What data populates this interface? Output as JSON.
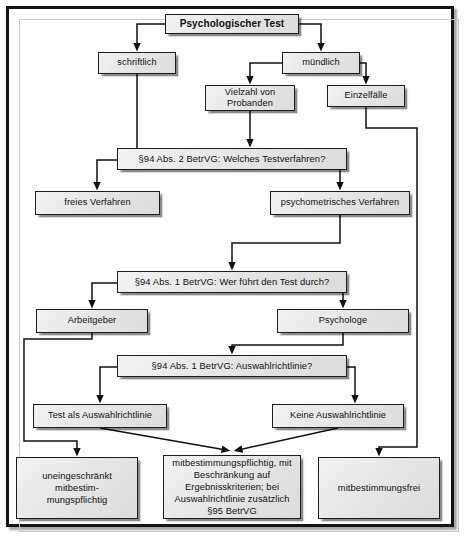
{
  "diagram": {
    "title": "Psychologischer Test",
    "nodes": [
      {
        "id": "root",
        "label": "Psychologischer Test",
        "kind": "root",
        "x": 165,
        "y": 14,
        "w": 134,
        "h": 20
      },
      {
        "id": "schriftlich",
        "label": "schriftlich",
        "kind": "box",
        "x": 98,
        "y": 52,
        "w": 78,
        "h": 22
      },
      {
        "id": "muendlich",
        "label": "mündlich",
        "kind": "box",
        "x": 282,
        "y": 52,
        "w": 78,
        "h": 22
      },
      {
        "id": "vielzahl",
        "label": "Vielzahl von Probanden",
        "kind": "box",
        "x": 205,
        "y": 85,
        "w": 90,
        "h": 26
      },
      {
        "id": "einzelfaelle",
        "label": "Einzelfälle",
        "kind": "box",
        "x": 327,
        "y": 85,
        "w": 78,
        "h": 22
      },
      {
        "id": "dec1",
        "label": "§94 Abs. 2 BetrVG: Welches Testverfahren?",
        "kind": "decision",
        "x": 117,
        "y": 148,
        "w": 230,
        "h": 22
      },
      {
        "id": "freies",
        "label": "freies Verfahren",
        "kind": "box",
        "x": 35,
        "y": 191,
        "w": 125,
        "h": 24
      },
      {
        "id": "psycho",
        "label": "psychometrisches Verfahren",
        "kind": "box",
        "x": 270,
        "y": 191,
        "w": 140,
        "h": 24
      },
      {
        "id": "dec2",
        "label": "§94 Abs. 1 BetrVG: Wer führt den Test durch?",
        "kind": "decision",
        "x": 117,
        "y": 271,
        "w": 230,
        "h": 22
      },
      {
        "id": "arbeitgeber",
        "label": "Arbeitgeber",
        "kind": "box",
        "x": 36,
        "y": 309,
        "w": 112,
        "h": 24
      },
      {
        "id": "psychologe",
        "label": "Psychologe",
        "kind": "box",
        "x": 277,
        "y": 309,
        "w": 132,
        "h": 24
      },
      {
        "id": "dec3",
        "label": "§94 Abs. 1 BetrVG: Auswahlrichtlinie?",
        "kind": "decision",
        "x": 117,
        "y": 355,
        "w": 230,
        "h": 22
      },
      {
        "id": "testals",
        "label": "Test als Auswahlrichtlinie",
        "kind": "box",
        "x": 33,
        "y": 404,
        "w": 134,
        "h": 24
      },
      {
        "id": "keineaus",
        "label": "Keine Auswahlrichtlinie",
        "kind": "box",
        "x": 272,
        "y": 404,
        "w": 132,
        "h": 24
      },
      {
        "id": "term-left",
        "label": "uneingeschränkt mitbestim-mungspflichtig",
        "kind": "terminal",
        "x": 16,
        "y": 457,
        "w": 122,
        "h": 62
      },
      {
        "id": "term-mid",
        "label": "mitbestimmungspflichtig, mit Beschränkung auf Ergebnisskriterien; bei Auswahlrichtlinie zusätzlich §95 BetrVG",
        "kind": "terminal",
        "x": 163,
        "y": 455,
        "w": 138,
        "h": 64
      },
      {
        "id": "term-right",
        "label": "mitbestimmungsfrei",
        "kind": "terminal",
        "x": 318,
        "y": 457,
        "w": 122,
        "h": 62
      }
    ],
    "terminal_lines": {
      "term-left": [
        "uneingeschränkt mitbestim-",
        "mungspflichtig"
      ],
      "term-mid": [
        "mitbestimmungspflichtig, mit",
        "Beschränkung auf",
        "Ergebnisskriterien; bei",
        "Auswahlrichtlinie zusätzlich",
        "§95 BetrVG"
      ],
      "term-right": [
        "mitbestimmungsfrei"
      ]
    },
    "node_lines": {
      "vielzahl": [
        "Vielzahl von",
        "Probanden"
      ]
    },
    "edges": [
      {
        "id": "root-to-schriftlich",
        "from": "root",
        "to": "schriftlich",
        "arrow": true
      },
      {
        "id": "root-to-muendlich",
        "from": "root",
        "to": "muendlich",
        "arrow": true
      },
      {
        "id": "muendlich-to-vielzahl",
        "from": "muendlich",
        "to": "vielzahl",
        "arrow": true
      },
      {
        "id": "muendlich-to-einzelfaelle",
        "from": "muendlich",
        "to": "einzelfaelle",
        "arrow": true
      },
      {
        "id": "schriftlich-to-dec1",
        "from": "schriftlich",
        "to": "dec1",
        "arrow": false
      },
      {
        "id": "vielzahl-to-dec1",
        "from": "vielzahl",
        "to": "dec1",
        "arrow": true
      },
      {
        "id": "dec1-to-freies",
        "from": "dec1",
        "to": "freies",
        "arrow": true
      },
      {
        "id": "dec1-to-psycho",
        "from": "dec1",
        "to": "psycho",
        "arrow": true
      },
      {
        "id": "einzelfaelle-to-right-rail",
        "from": "einzelfaelle",
        "to": "term-right",
        "arrow": true
      },
      {
        "id": "psycho-to-dec2",
        "from": "psycho",
        "to": "dec2",
        "arrow": true
      },
      {
        "id": "dec2-to-arbeitgeber",
        "from": "dec2",
        "to": "arbeitgeber",
        "arrow": true
      },
      {
        "id": "dec2-to-psychologe",
        "from": "dec2",
        "to": "psychologe",
        "arrow": true
      },
      {
        "id": "psychologe-to-dec3",
        "from": "psychologe",
        "to": "dec3",
        "arrow": true
      },
      {
        "id": "dec3-to-testals",
        "from": "dec3",
        "to": "testals",
        "arrow": true
      },
      {
        "id": "dec3-to-keineaus",
        "from": "dec3",
        "to": "keineaus",
        "arrow": true
      },
      {
        "id": "arbeitgeber-to-term-left",
        "from": "arbeitgeber",
        "to": "term-left",
        "arrow": true
      },
      {
        "id": "testals-to-term-mid",
        "from": "testals",
        "to": "term-mid",
        "arrow": true
      },
      {
        "id": "keineaus-to-term-mid",
        "from": "keineaus",
        "to": "term-mid",
        "arrow": true
      }
    ],
    "colors": {
      "node_fill": "#e8e8e8",
      "node_border": "#1d1d1d",
      "edge": "#111111",
      "frame": "#141414",
      "background": "#ffffff"
    }
  }
}
